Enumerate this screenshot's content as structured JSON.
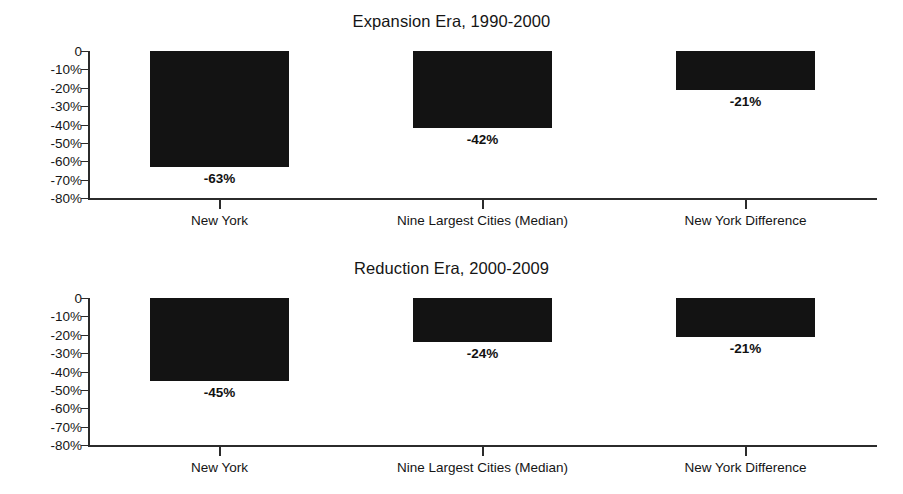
{
  "chart_data": [
    {
      "type": "bar",
      "title": "Expansion Era, 1990-2000",
      "xlabel": "",
      "ylabel": "",
      "ylim": [
        -80,
        0
      ],
      "grid": false,
      "legend": "none",
      "categories": [
        "New York",
        "Nine Largest Cities (Median)",
        "New York Difference"
      ],
      "values": [
        -63,
        -42,
        -21
      ],
      "data_labels": [
        "-63%",
        "-42%",
        "-21%"
      ],
      "ytick_labels": [
        "0",
        "-10%",
        "-20%",
        "-30%",
        "-40%",
        "-50%",
        "-60%",
        "-70%",
        "-80%"
      ],
      "ytick_values": [
        0,
        -10,
        -20,
        -30,
        -40,
        -50,
        -60,
        -70,
        -80
      ]
    },
    {
      "type": "bar",
      "title": "Reduction Era, 2000-2009",
      "xlabel": "",
      "ylabel": "",
      "ylim": [
        -80,
        0
      ],
      "grid": false,
      "legend": "none",
      "categories": [
        "New York",
        "Nine Largest Cities (Median)",
        "New York Difference"
      ],
      "values": [
        -45,
        -24,
        -21
      ],
      "data_labels": [
        "-45%",
        "-24%",
        "-21%"
      ],
      "ytick_labels": [
        "0",
        "-10%",
        "-20%",
        "-30%",
        "-40%",
        "-50%",
        "-60%",
        "-70%",
        "-80%"
      ],
      "ytick_values": [
        0,
        -10,
        -20,
        -30,
        -40,
        -50,
        -60,
        -70,
        -80
      ]
    }
  ],
  "colors": {
    "bar_fill": "#131313",
    "axis": "#2b2b2b",
    "text": "#151515",
    "background": "#ffffff"
  }
}
